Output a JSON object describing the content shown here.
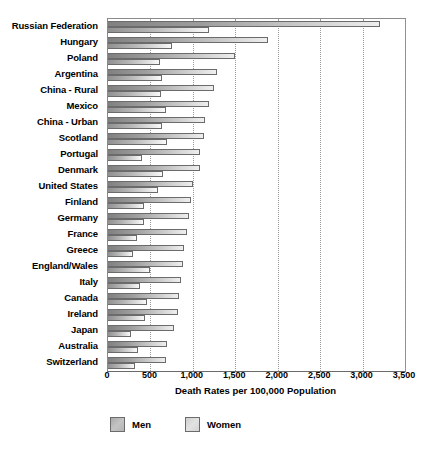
{
  "chart_data": {
    "type": "bar",
    "orientation": "horizontal",
    "title": "",
    "xlabel": "Death Rates per 100,000 Population",
    "ylabel": "",
    "xlim": [
      0,
      3500
    ],
    "xticks": [
      0,
      500,
      1000,
      1500,
      2000,
      2500,
      3000,
      3500
    ],
    "xtick_labels": [
      "0",
      "500",
      "1,000",
      "1,500",
      "2,000",
      "2,500",
      "3,000",
      "3,500"
    ],
    "grid": true,
    "grid_axis": "x",
    "legend_position": "bottom",
    "categories": [
      "Russian Federation",
      "Hungary",
      "Poland",
      "Argentina",
      "China - Rural",
      "Mexico",
      "China - Urban",
      "Scotland",
      "Portugal",
      "Denmark",
      "United States",
      "Finland",
      "Germany",
      "France",
      "Greece",
      "England/Wales",
      "Italy",
      "Canada",
      "Ireland",
      "Japan",
      "Australia",
      "Switzerland"
    ],
    "series": [
      {
        "name": "Men",
        "color": "#a9a9a9",
        "values": [
          3200,
          1880,
          1500,
          1290,
          1250,
          1190,
          1140,
          1130,
          1090,
          1080,
          1000,
          980,
          960,
          930,
          900,
          880,
          860,
          840,
          820,
          780,
          700,
          680
        ]
      },
      {
        "name": "Women",
        "color": "#d8d8d8",
        "values": [
          1190,
          760,
          610,
          640,
          620,
          680,
          640,
          700,
          400,
          650,
          590,
          420,
          430,
          340,
          290,
          500,
          380,
          460,
          440,
          270,
          350,
          320
        ]
      }
    ]
  },
  "legend": {
    "items": [
      {
        "label": "Men",
        "swatch": "men-swatch"
      },
      {
        "label": "Women",
        "swatch": "women-swatch"
      }
    ]
  }
}
